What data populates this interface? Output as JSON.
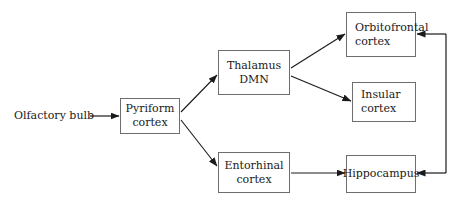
{
  "diagram": {
    "background_color": "#ffffff",
    "border_color": "#6e6e6e",
    "text_color": "#1a1a1a",
    "nodes": {
      "olfactory_bulb": {
        "label": "Olfactory bulb",
        "boxed": false
      },
      "pyriform": {
        "line1": "Pyriform",
        "line2": "cortex"
      },
      "thalamus": {
        "line1": "Thalamus",
        "line2": "DMN"
      },
      "entorhinal": {
        "line1": "Entorhinal",
        "line2": "cortex"
      },
      "orbitofrontal": {
        "line1": "Orbitofrontal",
        "line2": "cortex"
      },
      "insular": {
        "line1": "Insular",
        "line2": "cortex"
      },
      "hippocampus": {
        "line1": "Hippocampus",
        "line2": ""
      }
    },
    "edges": [
      {
        "from": "olfactory_bulb",
        "to": "pyriform",
        "style": "straight-horizontal",
        "arrow": "to"
      },
      {
        "from": "pyriform",
        "to": "thalamus",
        "style": "diagonal-up",
        "arrow": "to"
      },
      {
        "from": "pyriform",
        "to": "entorhinal",
        "style": "diagonal-down",
        "arrow": "to"
      },
      {
        "from": "thalamus",
        "to": "orbitofrontal",
        "style": "diagonal-up",
        "arrow": "to"
      },
      {
        "from": "thalamus",
        "to": "insular",
        "style": "diagonal-down",
        "arrow": "to"
      },
      {
        "from": "entorhinal",
        "to": "hippocampus",
        "style": "straight-horizontal",
        "arrow": "to"
      },
      {
        "from": "feedback_trunk",
        "to": "orbitofrontal",
        "style": "right-trunk-elbow",
        "arrow": "to"
      },
      {
        "from": "feedback_trunk",
        "to": "hippocampus",
        "style": "right-trunk-elbow",
        "arrow": "to"
      }
    ]
  }
}
